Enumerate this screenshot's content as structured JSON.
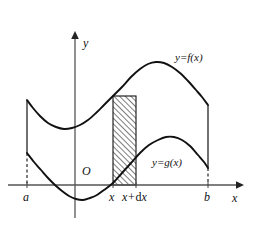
{
  "figure": {
    "background_color": "#ffffff",
    "stroke_color": "#111111"
  },
  "axes": {
    "x_axis_label": "x",
    "y_axis_label": "y",
    "origin_label": "O",
    "x_axis_y_px": 185,
    "y_axis_x_px": 75,
    "x_axis_start_px": 8,
    "x_axis_end_px": 243,
    "y_axis_top_px": 32,
    "y_axis_bottom_px": 218
  },
  "ticks": [
    {
      "name": "a",
      "label": "a",
      "x_px": 27
    },
    {
      "name": "x",
      "label": "x",
      "x_px": 113
    },
    {
      "name": "x-plus-dx",
      "label_prefix": "x+",
      "label_d": "d",
      "label_suffix": "x",
      "x_px": 136
    },
    {
      "name": "b",
      "label": "b",
      "x_px": 208
    }
  ],
  "curves": [
    {
      "name": "f",
      "label": "y=f(x)",
      "label_x_px": 175,
      "label_y_px": 58,
      "description": "upper curve",
      "points": [
        [
          27,
          100
        ],
        [
          33,
          108
        ],
        [
          40,
          116
        ],
        [
          48,
          123
        ],
        [
          56,
          127
        ],
        [
          64,
          129
        ],
        [
          72,
          128
        ],
        [
          80,
          125
        ],
        [
          88,
          120
        ],
        [
          96,
          113
        ],
        [
          104,
          105
        ],
        [
          113,
          96
        ],
        [
          122,
          87
        ],
        [
          131,
          77
        ],
        [
          140,
          69
        ],
        [
          148,
          64
        ],
        [
          156,
          62
        ],
        [
          164,
          63
        ],
        [
          172,
          67
        ],
        [
          180,
          73
        ],
        [
          188,
          81
        ],
        [
          196,
          90
        ],
        [
          202,
          97
        ],
        [
          208,
          105
        ]
      ]
    },
    {
      "name": "g",
      "label": "y=g(x)",
      "label_x_px": 152,
      "label_y_px": 163,
      "description": "lower curve",
      "points": [
        [
          27,
          153
        ],
        [
          34,
          162
        ],
        [
          41,
          170
        ],
        [
          48,
          178
        ],
        [
          55,
          185
        ],
        [
          62,
          191
        ],
        [
          69,
          196
        ],
        [
          76,
          199
        ],
        [
          83,
          200
        ],
        [
          90,
          198
        ],
        [
          97,
          195
        ],
        [
          104,
          190
        ],
        [
          113,
          183
        ],
        [
          122,
          173
        ],
        [
          131,
          163
        ],
        [
          140,
          153
        ],
        [
          149,
          145
        ],
        [
          158,
          140
        ],
        [
          166,
          137
        ],
        [
          174,
          137
        ],
        [
          182,
          140
        ],
        [
          190,
          146
        ],
        [
          198,
          155
        ],
        [
          204,
          162
        ],
        [
          208,
          168
        ]
      ]
    }
  ],
  "strip": {
    "name": "representative-rectangle",
    "left_x_px": 113,
    "right_x_px": 136,
    "top_y_px": 96,
    "bottom_y_px": 185,
    "hatch_angle_deg": 45,
    "hatch_spacing_px": 4,
    "fill": "hatched"
  },
  "boundary_segments": [
    {
      "name": "left-boundary-solid",
      "x_px": 27,
      "from_y_px": 100,
      "to_y_px": 153,
      "style": "solid"
    },
    {
      "name": "left-boundary-dashed",
      "x_px": 27,
      "from_y_px": 153,
      "to_y_px": 185,
      "style": "dashed"
    },
    {
      "name": "right-boundary-solid",
      "x_px": 208,
      "from_y_px": 105,
      "to_y_px": 168,
      "style": "solid"
    },
    {
      "name": "right-boundary-dashed",
      "x_px": 208,
      "from_y_px": 168,
      "to_y_px": 185,
      "style": "dashed"
    }
  ],
  "chart_data": {
    "type": "line",
    "xlabel": "x",
    "ylabel": "y",
    "grid": false,
    "legend": "inline-annotations",
    "xlim": [
      0,
      254
    ],
    "ylim": [
      0,
      233
    ],
    "annotations": [
      "y=f(x)",
      "y=g(x)",
      "a",
      "x",
      "x+dx",
      "b",
      "O"
    ],
    "series": [
      {
        "name": "y=f(x)",
        "x": [
          27,
          40,
          56,
          72,
          88,
          104,
          113,
          131,
          148,
          156,
          172,
          188,
          208
        ],
        "values": [
          100,
          116,
          127,
          128,
          120,
          105,
          96,
          77,
          64,
          62,
          67,
          81,
          105
        ]
      },
      {
        "name": "y=g(x)",
        "x": [
          27,
          41,
          55,
          69,
          83,
          97,
          113,
          131,
          149,
          166,
          174,
          190,
          208
        ],
        "values": [
          153,
          170,
          185,
          196,
          200,
          195,
          183,
          163,
          145,
          137,
          137,
          146,
          168
        ]
      }
    ]
  }
}
